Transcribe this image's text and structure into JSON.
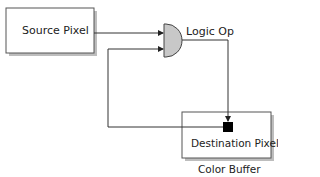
{
  "diagram": {
    "nodes": {
      "source": {
        "label": "Source Pixel"
      },
      "logic_op": {
        "label": "Logic Op"
      },
      "destination": {
        "label": "Destination Pixel"
      },
      "color_buffer": {
        "label": "Color Buffer"
      }
    },
    "edges": [
      {
        "from": "source",
        "to": "logic_op"
      },
      {
        "from": "destination",
        "to": "logic_op"
      },
      {
        "from": "logic_op",
        "to": "destination"
      }
    ],
    "colors": {
      "line": "#333333",
      "gate_fill": "#c8c8c8",
      "box_border": "#555555",
      "shadow": "#bbbbbb",
      "pixel": "#000000"
    }
  }
}
